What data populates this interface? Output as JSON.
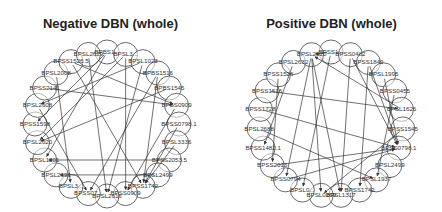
{
  "panels": [
    {
      "title": "Negative DBN (whole)",
      "center": [
        107,
        124
      ],
      "radius": 72,
      "node_radius": 12,
      "nodes": [
        "BPBS1...",
        "BPSL3...",
        "BPSL1023",
        "BPBS1516",
        "BPBS1545",
        "BPBS0909",
        "BPSS0798.1",
        "BPSL3336",
        "BPSS2053.5",
        "BPSL2499",
        "BPSS1742",
        "BPSS0909",
        "BPSL2616",
        "BPSS07...",
        "BPSL3...",
        "BPSL2691",
        "BPSL1201",
        "BPSL2020",
        "BPSS1598",
        "BPSL2608",
        "BPSS2141",
        "BPSL2008",
        "BPSS1526.5",
        "BPSL2629"
      ],
      "edges": [
        [
          1,
          17
        ],
        [
          1,
          11
        ],
        [
          0,
          16
        ],
        [
          2,
          19
        ],
        [
          3,
          10
        ],
        [
          4,
          17
        ],
        [
          22,
          10
        ],
        [
          23,
          12
        ],
        [
          21,
          14
        ],
        [
          20,
          5
        ],
        [
          19,
          13
        ],
        [
          6,
          10
        ],
        [
          7,
          10
        ],
        [
          8,
          16
        ],
        [
          9,
          15
        ],
        [
          3,
          13
        ],
        [
          2,
          12
        ],
        [
          22,
          5
        ],
        [
          0,
          18
        ],
        [
          5,
          11
        ]
      ]
    },
    {
      "title": "Positive DBN (whole)",
      "center": [
        331,
        124
      ],
      "radius": 72,
      "node_radius": 12,
      "nodes": [
        "BPSS1...",
        "BPSS0482",
        "BPSS1849",
        "BPSL1995",
        "BPSS0455",
        "BPSL1626",
        "BPSS1545",
        "BPSS0798.1",
        "BPSL2499",
        "BPSL1937",
        "BPSS1742",
        "BPSL1317",
        "BPSL0269",
        "BPSL0...",
        "BPSS0794",
        "BPSS2013",
        "BPSS1482.1",
        "BPSL2688",
        "BPSS1728",
        "BPSS1616",
        "BPSS1526",
        "BPSL2632",
        "BPSL2520"
      ],
      "edges": [
        [
          22,
          12
        ],
        [
          22,
          14
        ],
        [
          2,
          7
        ],
        [
          1,
          7
        ],
        [
          3,
          7
        ],
        [
          4,
          9
        ],
        [
          18,
          7
        ],
        [
          17,
          9
        ],
        [
          19,
          5
        ],
        [
          20,
          15
        ],
        [
          21,
          16
        ],
        [
          0,
          13
        ],
        [
          14,
          7
        ],
        [
          15,
          7
        ],
        [
          22,
          11
        ],
        [
          6,
          12
        ],
        [
          2,
          10
        ],
        [
          1,
          11
        ],
        [
          5,
          22
        ],
        [
          0,
          22
        ]
      ]
    }
  ]
}
